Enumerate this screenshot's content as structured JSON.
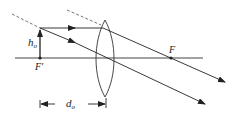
{
  "diagram": {
    "type": "converging-lens-ray-diagram",
    "labels": {
      "object_height": "h",
      "object_height_sub": "o",
      "focal_point_right": "F",
      "focal_point_left": "F'",
      "object_distance": "d",
      "object_distance_sub": "o"
    },
    "colors": {
      "line": "#222222",
      "axis": "#444444",
      "dashed": "#666666"
    }
  }
}
